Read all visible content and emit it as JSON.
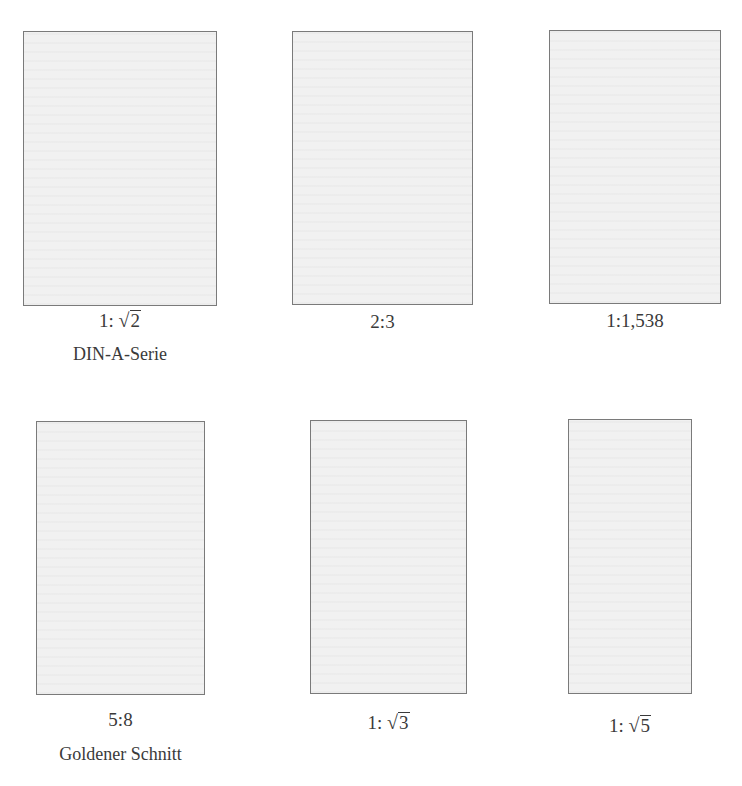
{
  "figure": {
    "rows": [
      {
        "items": [
          {
            "id": "din",
            "ratio_prefix": "1:",
            "ratio_text": "",
            "sqrt_radicand": "2",
            "caption": "DIN-A-Serie",
            "aspect": 1.4142
          },
          {
            "id": "two-three",
            "ratio_prefix": "",
            "ratio_text": "2:3",
            "sqrt_radicand": "",
            "caption": "",
            "aspect": 1.5
          },
          {
            "id": "one-1538",
            "ratio_prefix": "",
            "ratio_text": "1:1,538",
            "sqrt_radicand": "",
            "caption": "",
            "aspect": 1.538
          }
        ]
      },
      {
        "items": [
          {
            "id": "five-eight",
            "ratio_prefix": "",
            "ratio_text": "5:8",
            "sqrt_radicand": "",
            "caption": "Goldener Schnitt",
            "aspect": 1.6
          },
          {
            "id": "sqrt3",
            "ratio_prefix": "1:",
            "ratio_text": "",
            "sqrt_radicand": "3",
            "caption": "",
            "aspect": 1.7321
          },
          {
            "id": "sqrt5",
            "ratio_prefix": "1:",
            "ratio_text": "",
            "sqrt_radicand": "5",
            "caption": "",
            "aspect": 2.2361
          }
        ]
      }
    ],
    "colors": {
      "page_fill": "#f1f1f1",
      "page_border": "#7a7a7a",
      "text": "#3a3a3a"
    },
    "sqrt_symbol": "√"
  }
}
